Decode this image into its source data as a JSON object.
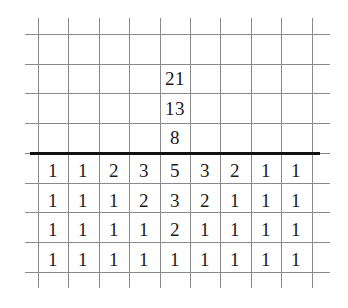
{
  "figure": {
    "name": "fibonacci-grid-table",
    "background_color": "#ffffff",
    "grid_line_color": "#8a8a8a",
    "rule_color": "#111111",
    "text_color": "#1a1a1a"
  },
  "geometry": {
    "table_left": 38,
    "table_right": 312,
    "column_count": 9,
    "column_width": 30.4,
    "row_height": 29.7,
    "grid_first_hline_y": 34,
    "bold_rule_y": 152,
    "vline_top": 18,
    "vline_bottom": 288,
    "hline_left": 25,
    "hline_right": 330,
    "vline_count": 10,
    "hline_count": 9
  },
  "chart_data": {
    "type": "table",
    "title": "",
    "xlabel": "",
    "ylabel": "",
    "column_headers": [
      "1",
      "2",
      "3",
      "4",
      "5",
      "6",
      "7",
      "8",
      "9"
    ],
    "rows_below_rule": [
      [
        "1",
        "1",
        "2",
        "3",
        "5",
        "3",
        "2",
        "1",
        "1"
      ],
      [
        "1",
        "1",
        "1",
        "2",
        "3",
        "2",
        "1",
        "1",
        "1"
      ],
      [
        "1",
        "1",
        "1",
        "1",
        "2",
        "1",
        "1",
        "1",
        "1"
      ],
      [
        "1",
        "1",
        "1",
        "1",
        "1",
        "1",
        "1",
        "1",
        "1"
      ]
    ],
    "column_above_rule": {
      "column_index": 5,
      "values_top_to_bottom": [
        "21",
        "13",
        "8"
      ]
    },
    "legend": [],
    "grid": true
  }
}
